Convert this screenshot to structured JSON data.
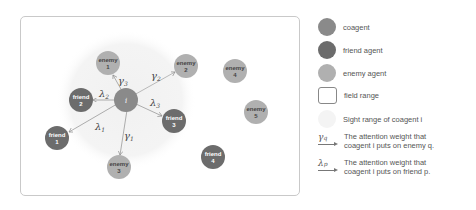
{
  "colors": {
    "coagent": "#8a8a8a",
    "friend": "#6c6c6c",
    "enemy": "#b0b0b0",
    "sight_range": "#f3f3f3",
    "field_border": "#c9c9c9",
    "edge": "#999999"
  },
  "diagram": {
    "coagent": {
      "label": "i",
      "x": 126,
      "y": 100
    },
    "friends": [
      {
        "name": "friend",
        "num": "1",
        "x": 57,
        "y": 138
      },
      {
        "name": "friend",
        "num": "2",
        "x": 81,
        "y": 100
      },
      {
        "name": "friend",
        "num": "3",
        "x": 174,
        "y": 121
      },
      {
        "name": "friend",
        "num": "4",
        "x": 213,
        "y": 157
      }
    ],
    "enemies": [
      {
        "name": "enemy",
        "num": "1",
        "x": 108,
        "y": 63
      },
      {
        "name": "enemy",
        "num": "2",
        "x": 186,
        "y": 66
      },
      {
        "name": "enemy",
        "num": "3",
        "x": 119,
        "y": 167
      },
      {
        "name": "enemy",
        "num": "4",
        "x": 235,
        "y": 71
      },
      {
        "name": "enemy",
        "num": "5",
        "x": 256,
        "y": 112
      }
    ],
    "edge_labels": {
      "gamma1": {
        "sym": "γ",
        "sub": "1"
      },
      "gamma2": {
        "sym": "γ",
        "sub": "2"
      },
      "gamma3": {
        "sym": "γ",
        "sub": "3"
      },
      "lambda1": {
        "sym": "λ",
        "sub": "1"
      },
      "lambda2": {
        "sym": "λ",
        "sub": "2"
      },
      "lambda3": {
        "sym": "λ",
        "sub": "3"
      }
    }
  },
  "legend": {
    "coagent": "coagent",
    "friend": "friend agent",
    "enemy": "enemy agent",
    "field": "field range",
    "sight": "Sight range of coagent i",
    "gamma_sym": "γ",
    "gamma_sub": "q",
    "gamma_text_1": "The attention weight that",
    "gamma_text_2": "coagent i puts on enemy q.",
    "lambda_sym": "λ",
    "lambda_sub": "p",
    "lambda_text_1": "The attention weight that",
    "lambda_text_2": "coagent i puts on friend p."
  }
}
